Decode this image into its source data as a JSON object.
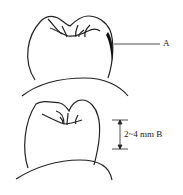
{
  "diagram": {
    "top_figure": {
      "label": "A",
      "description": "tooth crown with shaded region on right side"
    },
    "bottom_figure": {
      "dimension_label": "2~4 mm B"
    }
  }
}
